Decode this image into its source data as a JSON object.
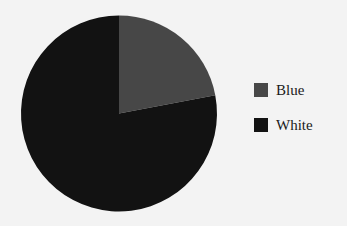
{
  "chart_data": {
    "type": "pie",
    "title": "",
    "categories": [
      "Blue",
      "White"
    ],
    "values": [
      22,
      78
    ],
    "colors": [
      "#474747",
      "#121212"
    ],
    "start_angle_deg": 0,
    "direction": "clockwise",
    "legend": {
      "position": "right",
      "entries": [
        "Blue",
        "White"
      ]
    }
  },
  "legend": {
    "items": [
      {
        "label": "Blue",
        "color": "#474747"
      },
      {
        "label": "White",
        "color": "#121212"
      }
    ]
  }
}
